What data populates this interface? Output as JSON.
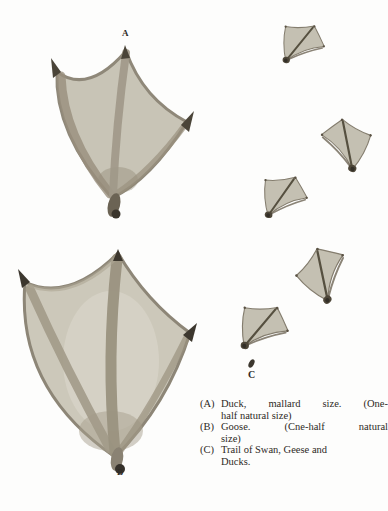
{
  "page": {
    "type": "scanned-book-figure",
    "colors": {
      "paper": "#fdfdfc",
      "web_fill": "#c6c2b4",
      "ridge_ink": "#9a9280",
      "claw_ink": "#3c372e",
      "text_ink": "#2e2a25"
    }
  },
  "figure": {
    "labels": {
      "a": "A",
      "b": "B",
      "c": "C"
    },
    "illustrations": {
      "a": "duck-webbed-footprint",
      "b": "goose-webbed-footprint",
      "trail": "trail-of-webbed-footprints",
      "speck": "trail-speck"
    },
    "caption": {
      "entries": [
        {
          "marker": "(A)",
          "lines": [
            "Duck, mallard size. (One-",
            "half natural size)"
          ]
        },
        {
          "marker": "(B)",
          "lines": [
            "Goose. (Cne-half natural",
            "size)"
          ]
        },
        {
          "marker": "(C)",
          "lines": [
            "Trail of Swan, Geese and",
            "Ducks."
          ]
        }
      ]
    }
  }
}
